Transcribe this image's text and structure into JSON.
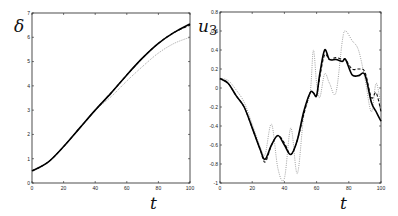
{
  "chart_data": [
    {
      "type": "line",
      "title": "",
      "xlabel": "t",
      "ylabel": "δ",
      "xlim": [
        0,
        100
      ],
      "ylim": [
        0,
        7
      ],
      "xticks": [
        "0",
        "20",
        "40",
        "60",
        "80",
        "100"
      ],
      "yticks": [
        "0",
        "1",
        "2",
        "3",
        "4",
        "5",
        "6",
        "7"
      ],
      "grid": false,
      "legend": null,
      "x": [
        0,
        10,
        20,
        30,
        40,
        50,
        60,
        70,
        80,
        90,
        100
      ],
      "series": [
        {
          "name": "solid",
          "style": "solid",
          "values": [
            0.5,
            0.85,
            1.5,
            2.25,
            3.0,
            3.7,
            4.45,
            5.15,
            5.75,
            6.2,
            6.55
          ]
        },
        {
          "name": "dashed",
          "style": "dashed",
          "values": [
            0.5,
            0.85,
            1.5,
            2.25,
            3.0,
            3.7,
            4.45,
            5.15,
            5.75,
            6.2,
            6.5
          ]
        },
        {
          "name": "dotted",
          "style": "dotted",
          "values": [
            0.5,
            0.85,
            1.5,
            2.25,
            3.0,
            3.55,
            4.2,
            4.8,
            5.35,
            5.75,
            6.0
          ]
        }
      ]
    },
    {
      "type": "line",
      "title": "",
      "xlabel": "t",
      "ylabel": "u3",
      "xlim": [
        0,
        100
      ],
      "ylim": [
        -1,
        0.8
      ],
      "xticks": [
        "0",
        "20",
        "40",
        "60",
        "80",
        "100"
      ],
      "yticks": [
        "-1",
        "-0.8",
        "-0.6",
        "-0.4",
        "-0.2",
        "0",
        "0.2",
        "0.4",
        "0.6",
        "0.8"
      ],
      "grid": false,
      "legend": null,
      "x": [
        0,
        5,
        10,
        15,
        20,
        25,
        28,
        32,
        36,
        40,
        44,
        48,
        52,
        56,
        58,
        60,
        62,
        65,
        68,
        72,
        76,
        78,
        82,
        86,
        90,
        94,
        97,
        100
      ],
      "series": [
        {
          "name": "solid",
          "style": "solid",
          "values": [
            0.1,
            0.05,
            -0.08,
            -0.2,
            -0.42,
            -0.65,
            -0.75,
            -0.6,
            -0.5,
            -0.6,
            -0.7,
            -0.55,
            -0.25,
            -0.05,
            -0.05,
            -0.08,
            0.15,
            0.4,
            0.3,
            0.3,
            0.28,
            0.3,
            0.14,
            0.13,
            0.14,
            -0.15,
            -0.25,
            -0.35
          ]
        },
        {
          "name": "dashed",
          "style": "dashed",
          "values": [
            0.1,
            0.05,
            -0.08,
            -0.2,
            -0.42,
            -0.65,
            -0.78,
            -0.6,
            -0.5,
            -0.58,
            -0.7,
            -0.55,
            -0.28,
            -0.05,
            -0.05,
            -0.08,
            0.12,
            0.35,
            0.3,
            0.32,
            0.3,
            0.3,
            0.2,
            0.2,
            0.17,
            -0.1,
            -0.05,
            -0.25
          ]
        },
        {
          "name": "dotted",
          "style": "dotted",
          "values": [
            0.1,
            0.08,
            -0.02,
            -0.15,
            -0.38,
            -0.62,
            -0.7,
            -0.38,
            -0.85,
            -0.95,
            -0.42,
            -0.9,
            -0.3,
            -0.05,
            0.4,
            0.05,
            -0.1,
            0.15,
            0.05,
            -0.05,
            0.5,
            0.6,
            0.5,
            0.4,
            0.1,
            -0.25,
            0.05,
            -0.2
          ]
        }
      ]
    }
  ],
  "labels": {
    "left_ylabel": "δ",
    "left_xlabel": "t",
    "right_ylabel": "u",
    "right_ylabel_sub": "3",
    "right_xlabel": "t"
  }
}
